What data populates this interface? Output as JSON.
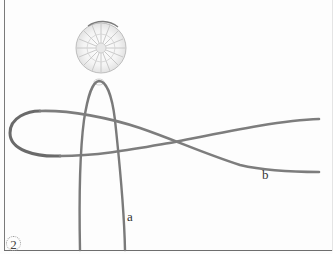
{
  "figure": {
    "step_number": "2",
    "labels": {
      "cord_a": "a",
      "cord_b": "b"
    },
    "elements": {
      "bead": "round faceted crystal bead",
      "cord_a": "vertical folded cord loop hanging from bead",
      "cord_b": "horizontal cord forming a figure loop crossing cord a"
    },
    "colors": {
      "cord": "#7d7d7d",
      "cord_edge": "#5e5e5e",
      "bead_outline": "#9a9a9a",
      "bead_facets": "#c8c8c8",
      "border": "#7a7a7a",
      "background": "#fdfdfd",
      "label": "#333333"
    }
  }
}
